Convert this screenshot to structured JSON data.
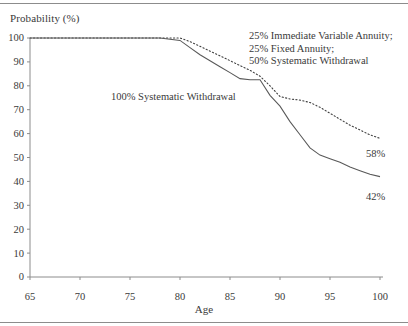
{
  "chart_data": {
    "type": "line",
    "title": "",
    "xlabel": "Age",
    "ylabel": "Probability (%)",
    "xlim": [
      65,
      100
    ],
    "ylim": [
      0,
      100
    ],
    "xticks": [
      65,
      70,
      75,
      80,
      85,
      90,
      95,
      100
    ],
    "yticks": [
      0,
      10,
      20,
      30,
      40,
      50,
      60,
      70,
      80,
      90,
      100
    ],
    "grid": false,
    "legend_position": "in-plot annotations",
    "series": [
      {
        "name": "25% Immediate Variable Annuity; 25% Fixed Annuity; 50% Systematic Withdrawal",
        "style": "dotted",
        "color": "#404040",
        "end_label": "58%",
        "x": [
          65,
          70,
          75,
          78,
          80,
          81,
          82,
          83,
          84,
          85,
          86,
          87,
          88,
          89,
          90,
          91,
          92,
          93,
          94,
          95,
          96,
          97,
          98,
          99,
          100
        ],
        "values": [
          100,
          100,
          100,
          100,
          100,
          98.5,
          96.5,
          94.5,
          92.5,
          90.5,
          88.5,
          86.5,
          84,
          80,
          75.5,
          74.5,
          74,
          73,
          71,
          68.5,
          66,
          63.5,
          61.5,
          59.5,
          58
        ]
      },
      {
        "name": "100% Systematic Withdrawal",
        "style": "solid",
        "color": "#585858",
        "end_label": "42%",
        "x": [
          65,
          70,
          75,
          78,
          79,
          80,
          81,
          82,
          83,
          84,
          85,
          86,
          87,
          88,
          89,
          90,
          91,
          92,
          93,
          94,
          95,
          96,
          97,
          98,
          99,
          100
        ],
        "values": [
          100,
          100,
          100,
          100,
          99.5,
          99,
          96,
          93,
          90.5,
          88,
          85.5,
          83,
          82.5,
          82.5,
          76,
          71.5,
          65,
          59.5,
          54,
          51,
          49.5,
          48,
          46,
          44.5,
          43,
          42
        ]
      }
    ],
    "annotations": [
      {
        "name": "legend-annuity-mix",
        "lines": [
          "25% Immediate Variable Annuity;",
          "25% Fixed Annuity;",
          "50% Systematic Withdrawal"
        ]
      },
      {
        "name": "legend-systematic-withdrawal",
        "lines": [
          "100% Systematic Withdrawal"
        ]
      }
    ]
  },
  "axis": {
    "ylabel": "Probability (%)",
    "xlabel": "Age",
    "ytick_labels": [
      "100",
      "90",
      "80",
      "70",
      "60",
      "50",
      "40",
      "30",
      "20",
      "10",
      "0"
    ],
    "xtick_labels": [
      "65",
      "70",
      "75",
      "80",
      "85",
      "90",
      "95",
      "100"
    ]
  },
  "labels": {
    "legend_line1": "25% Immediate Variable Annuity;",
    "legend_line2": "25% Fixed Annuity;",
    "legend_line3": "50% Systematic Withdrawal",
    "solid_series": "100% Systematic Withdrawal",
    "end_dotted": "58%",
    "end_solid": "42%"
  },
  "colors": {
    "axis": "#8c8c8c",
    "solid_line": "#585858",
    "dotted_line": "#404040",
    "text": "#3a3a3a"
  }
}
